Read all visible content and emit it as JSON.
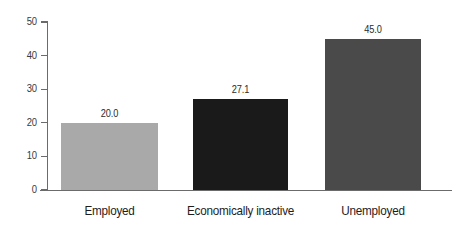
{
  "chart_data": {
    "type": "bar",
    "title": "",
    "subtitle": "",
    "xlabel": "",
    "ylabel": "",
    "categories": [
      "Employed",
      "Economically inactive",
      "Unemployed"
    ],
    "values": [
      20.0,
      27.1,
      45.0
    ],
    "data_labels": [
      "20.0",
      "27.1",
      "45.0"
    ],
    "bar_colors": [
      "#a9a9a9",
      "#1a1a1a",
      "#4a4a4a"
    ],
    "ylim": [
      0,
      50
    ],
    "yticks": [
      0,
      10,
      20,
      30,
      40,
      50
    ],
    "ytick_labels": [
      "0",
      "10",
      "20",
      "30",
      "40",
      "50"
    ],
    "grid": false,
    "legend": false,
    "legend_position": "none",
    "background_color": "#ffffff",
    "axis_color": "#6b6b6b"
  }
}
